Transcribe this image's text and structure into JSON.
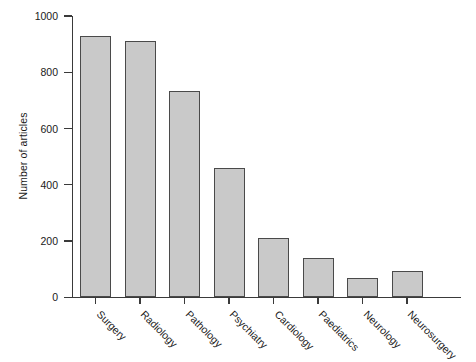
{
  "chart_data": {
    "type": "bar",
    "title": "",
    "subtitle": "",
    "xlabel": "",
    "ylabel": "Number of articles",
    "categories": [
      "Surgery",
      "Radiology",
      "Pathology",
      "Psychiatry",
      "Cardiology",
      "Paediatrics",
      "Neurology",
      "Neurosurgery"
    ],
    "values": [
      930,
      910,
      735,
      460,
      210,
      138,
      68,
      95
    ],
    "ylim": [
      0,
      1000
    ],
    "yticks": [
      0,
      200,
      400,
      600,
      800,
      1000
    ],
    "ytick_labels": [
      "0",
      "200",
      "400",
      "600",
      "800",
      "1000"
    ],
    "grid": false,
    "legend": false,
    "bar_fill_color": "#c9c9c9",
    "bar_edge_color": "#4a4a4a",
    "axis_color": "#3a3a3a",
    "background_color": "#ffffff",
    "xtick_label_rotation": 45
  }
}
